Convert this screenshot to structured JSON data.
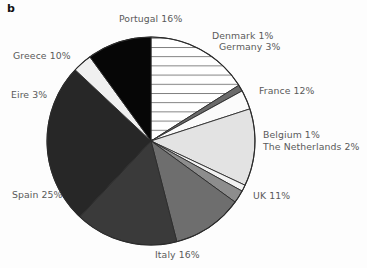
{
  "figure": {
    "panel_label": "b",
    "background_color": "#fdfdfd",
    "label_text_color": "#5a5a5a",
    "outline_color": "#2b2b2b"
  },
  "chart_data": {
    "type": "pie",
    "title": "",
    "xlabel": "",
    "ylabel": "",
    "legend_position": "none",
    "grid": false,
    "units": "percent",
    "start_angle_deg": 0,
    "direction": "clockwise",
    "total": 100,
    "categories": [
      "Portugal",
      "Denmark",
      "Germany",
      "France",
      "Belgium",
      "The Netherlands",
      "UK",
      "Italy",
      "Spain",
      "Eire",
      "Greece"
    ],
    "values": [
      16,
      1,
      3,
      12,
      1,
      2,
      11,
      16,
      25,
      3,
      10
    ],
    "slices": [
      {
        "key": "portugal",
        "name": "Portugal",
        "value": 16,
        "label": "Portugal 16%",
        "fill": "#ffffff",
        "pattern": "horizontal-lines",
        "pattern_color": "#6f6f6f"
      },
      {
        "key": "denmark",
        "name": "Denmark",
        "value": 1,
        "label": "Denmark 1%",
        "fill": "#6a6a6a",
        "pattern": "solid",
        "pattern_color": ""
      },
      {
        "key": "germany",
        "name": "Germany",
        "value": 3,
        "label": "Germany 3%",
        "fill": "#fbfbfb",
        "pattern": "solid",
        "pattern_color": ""
      },
      {
        "key": "france",
        "name": "France",
        "value": 12,
        "label": "France 12%",
        "fill": "#e3e3e3",
        "pattern": "solid",
        "pattern_color": ""
      },
      {
        "key": "belgium",
        "name": "Belgium",
        "value": 1,
        "label": "Belgium 1%",
        "fill": "#f2f2f2",
        "pattern": "solid",
        "pattern_color": ""
      },
      {
        "key": "netherlands",
        "name": "The Netherlands",
        "value": 2,
        "label": "The Netherlands 2%",
        "fill": "#8d8d8d",
        "pattern": "solid",
        "pattern_color": ""
      },
      {
        "key": "uk",
        "name": "UK",
        "value": 11,
        "label": "UK 11%",
        "fill": "#6e6e6e",
        "pattern": "solid",
        "pattern_color": ""
      },
      {
        "key": "italy",
        "name": "Italy",
        "value": 16,
        "label": "Italy 16%",
        "fill": "#3a3a3a",
        "pattern": "solid",
        "pattern_color": ""
      },
      {
        "key": "spain",
        "name": "Spain",
        "value": 25,
        "label": "Spain 25%",
        "fill": "#272727",
        "pattern": "solid",
        "pattern_color": ""
      },
      {
        "key": "eire",
        "name": "Eire",
        "value": 3,
        "label": "Eire 3%",
        "fill": "#f0f0f0",
        "pattern": "solid",
        "pattern_color": ""
      },
      {
        "key": "greece",
        "name": "Greece",
        "value": 10,
        "label": "Greece 10%",
        "fill": "#060606",
        "pattern": "solid",
        "pattern_color": ""
      }
    ],
    "geometry": {
      "center_x": 151,
      "center_y": 141,
      "radius": 104
    }
  }
}
